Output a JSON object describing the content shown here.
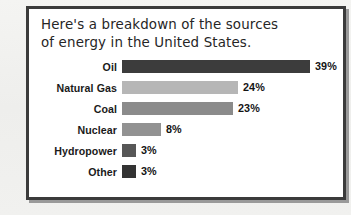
{
  "panel": {
    "title": "Here's a breakdown of the sources\nof energy in the United States.",
    "border_color": "#3b3b3b",
    "background_color": "#ffffff"
  },
  "chart_data": {
    "type": "bar",
    "orientation": "horizontal",
    "title": "Here's a breakdown of the sources of energy in the United States.",
    "xlabel": "",
    "ylabel": "",
    "xlim": [
      0,
      39
    ],
    "grid": false,
    "legend": "none",
    "value_suffix": "%",
    "categories": [
      "Oil",
      "Natural Gas",
      "Coal",
      "Nuclear",
      "Hydropower",
      "Other"
    ],
    "values": [
      39,
      24,
      23,
      8,
      3,
      3
    ],
    "value_labels": [
      "39%",
      "24%",
      "23%",
      "8%",
      "3%",
      "3%"
    ],
    "bar_colors": [
      "#3c3c3c",
      "#b6b6b6",
      "#8b8b8b",
      "#929292",
      "#575757",
      "#333333"
    ],
    "bars": [
      {
        "label": "Oil",
        "value": 39,
        "value_label": "39%",
        "color": "#3c3c3c"
      },
      {
        "label": "Natural Gas",
        "value": 24,
        "value_label": "24%",
        "color": "#b6b6b6"
      },
      {
        "label": "Coal",
        "value": 23,
        "value_label": "23%",
        "color": "#8b8b8b"
      },
      {
        "label": "Nuclear",
        "value": 8,
        "value_label": "8%",
        "color": "#929292"
      },
      {
        "label": "Hydropower",
        "value": 3,
        "value_label": "3%",
        "color": "#575757"
      },
      {
        "label": "Other",
        "value": 3,
        "value_label": "3%",
        "color": "#333333"
      }
    ]
  }
}
